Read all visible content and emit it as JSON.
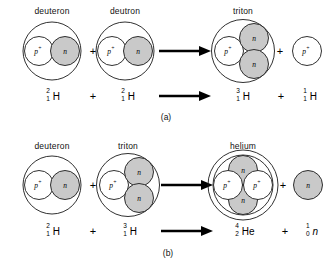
{
  "figure": {
    "type": "nuclear-fusion-reaction-diagram",
    "particle_symbols": {
      "proton": "p",
      "proton_charge": "+",
      "neutron": "n"
    },
    "colors": {
      "proton_fill": "#ffffff",
      "neutron_fill": "#c9c9c9",
      "stroke": "#1a1a1a",
      "background": "#ffffff"
    },
    "reactions": [
      {
        "id": "a",
        "caption": "(a)",
        "pictorial": {
          "reactants": [
            {
              "label": "deuteron",
              "kind": "deuteron",
              "protons": 1,
              "neutrons": 1
            },
            {
              "label": "deutron",
              "kind": "deuteron",
              "protons": 1,
              "neutrons": 1
            }
          ],
          "products": [
            {
              "label": "triton",
              "kind": "triton",
              "protons": 1,
              "neutrons": 2
            },
            {
              "label": "",
              "kind": "free-proton",
              "protons": 1,
              "neutrons": 0
            }
          ],
          "operator": "+",
          "arrow": "right-arrow"
        },
        "equation": {
          "reactants": [
            {
              "mass_number": "2",
              "atomic_number": "1",
              "symbol": "H",
              "italic": false
            },
            {
              "mass_number": "2",
              "atomic_number": "1",
              "symbol": "H",
              "italic": false
            }
          ],
          "products": [
            {
              "mass_number": "3",
              "atomic_number": "1",
              "symbol": "H",
              "italic": false
            },
            {
              "mass_number": "1",
              "atomic_number": "1",
              "symbol": "H",
              "italic": false
            }
          ],
          "operator": "+",
          "arrow": "right-arrow"
        }
      },
      {
        "id": "b",
        "caption": "(b)",
        "pictorial": {
          "reactants": [
            {
              "label": "deuteron",
              "kind": "deuteron",
              "protons": 1,
              "neutrons": 1
            },
            {
              "label": "triton",
              "kind": "triton",
              "protons": 1,
              "neutrons": 2
            }
          ],
          "products": [
            {
              "label": "helium",
              "kind": "helium",
              "protons": 2,
              "neutrons": 2
            },
            {
              "label": "",
              "kind": "free-neutron",
              "protons": 0,
              "neutrons": 1
            }
          ],
          "operator": "+",
          "arrow": "right-arrow"
        },
        "equation": {
          "reactants": [
            {
              "mass_number": "2",
              "atomic_number": "1",
              "symbol": "H",
              "italic": false
            },
            {
              "mass_number": "3",
              "atomic_number": "1",
              "symbol": "H",
              "italic": false
            }
          ],
          "products": [
            {
              "mass_number": "4",
              "atomic_number": "2",
              "symbol": "He",
              "italic": false
            },
            {
              "mass_number": "1",
              "atomic_number": "0",
              "symbol": "n",
              "italic": true
            }
          ],
          "operator": "+",
          "arrow": "right-arrow"
        }
      }
    ]
  }
}
